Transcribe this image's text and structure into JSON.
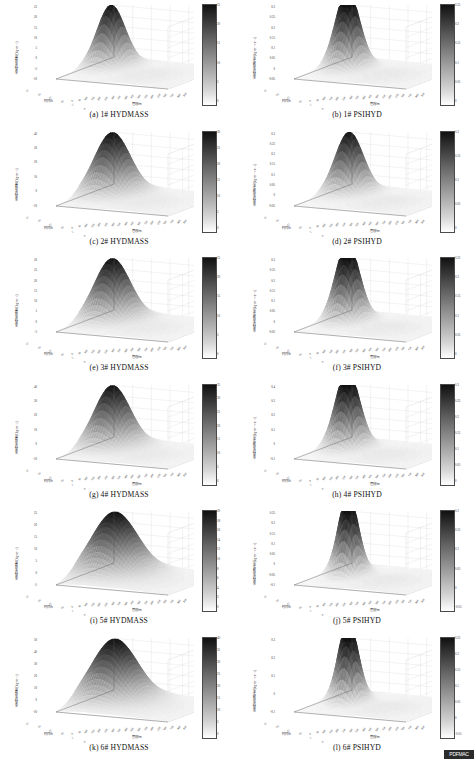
{
  "figure": {
    "axis_labels": {
      "vertical_mass": "水合物生成量/(kg·m⁻³)",
      "vertical_fraction": "水合物生成量/(kg·m⁻³·s⁻¹)",
      "time": "时间/h",
      "pipe": "管段/m"
    },
    "watermark": "PDFMAC"
  },
  "panels": [
    {
      "key": "a",
      "caption": "(a)  1# HYDMASS",
      "ylabel": "水合物生成量/(kg·m⁻³)",
      "xlabel_left": "时间/h",
      "xlabel_right": "管段/m",
      "yticks": [
        "25",
        "20",
        "15",
        "10",
        "5",
        "0",
        "-5",
        "-10"
      ],
      "xticks_left": [
        "25",
        "20",
        "15",
        "10",
        "5",
        "0"
      ],
      "xticks_right": [
        "0",
        "50",
        "100",
        "150",
        "200",
        "250",
        "300",
        "350",
        "400",
        "450",
        "500",
        "550",
        "600",
        "650",
        "700",
        "750",
        "800",
        "850"
      ],
      "colorbar_ticks": [
        "25",
        "20",
        "15",
        "10",
        "5",
        "0"
      ],
      "colorbar_min": 0,
      "colorbar_max": 25,
      "peak_value": 25,
      "peak_shape": "single-narrow",
      "base_color": "#9a9a9a"
    },
    {
      "key": "b",
      "caption": "(b)  1# PSIHYD",
      "ylabel": "水合物生成速率/(kg·m⁻³·s⁻¹)",
      "xlabel_left": "时间/h",
      "xlabel_right": "管段/m",
      "yticks": [
        "0.3",
        "0.25",
        "0.2",
        "0.15",
        "0.1",
        "0.05",
        "0",
        "-0.05"
      ],
      "xticks_left": [
        "25",
        "20",
        "15",
        "10",
        "5",
        "0"
      ],
      "xticks_right": [
        "0",
        "50",
        "100",
        "150",
        "200",
        "250",
        "300",
        "350",
        "400",
        "450",
        "500",
        "550",
        "600",
        "650",
        "700",
        "750",
        "800",
        "850"
      ],
      "colorbar_ticks": [
        "0.25",
        "0.2",
        "0.15",
        "0.1",
        "0.05",
        "0"
      ],
      "colorbar_min": 0,
      "colorbar_max": 0.25,
      "peak_value": 0.3,
      "peak_shape": "double-ridge",
      "base_color": "#9a9a9a"
    },
    {
      "key": "c",
      "caption": "(c)  2# HYDMASS",
      "ylabel": "水合物生成量/(kg·m⁻³)",
      "xlabel_left": "时间/h",
      "xlabel_right": "管段/m",
      "yticks": [
        "40",
        "30",
        "20",
        "10",
        "0",
        "-10"
      ],
      "xticks_left": [
        "25",
        "20",
        "15",
        "10",
        "5",
        "0"
      ],
      "xticks_right": [
        "0",
        "50",
        "100",
        "150",
        "200",
        "250",
        "300",
        "350",
        "400",
        "450",
        "500",
        "550",
        "600",
        "650",
        "700",
        "750",
        "800",
        "850"
      ],
      "colorbar_ticks": [
        "30",
        "25",
        "20",
        "15",
        "10",
        "5",
        "0"
      ],
      "colorbar_min": 0,
      "colorbar_max": 30,
      "peak_value": 35,
      "peak_shape": "single-broad",
      "base_color": "#9a9a9a"
    },
    {
      "key": "d",
      "caption": "(d)  2# PSIHYD",
      "ylabel": "水合物生成速率/(kg·m⁻³·s⁻¹)",
      "xlabel_left": "时间/h",
      "xlabel_right": "管段/m",
      "yticks": [
        "0.3",
        "0.25",
        "0.2",
        "0.15",
        "0.1",
        "0.05",
        "0",
        "-0.05"
      ],
      "xticks_left": [
        "25",
        "20",
        "15",
        "10",
        "5",
        "0"
      ],
      "xticks_right": [
        "0",
        "50",
        "100",
        "150",
        "200",
        "250",
        "300",
        "350",
        "400",
        "450",
        "500",
        "550",
        "600",
        "650",
        "700",
        "750",
        "800",
        "850"
      ],
      "colorbar_ticks": [
        "0.2",
        "0.15",
        "0.1",
        "0.05",
        "0"
      ],
      "colorbar_min": 0,
      "colorbar_max": 0.2,
      "peak_value": 0.28,
      "peak_shape": "single-narrow",
      "base_color": "#9a9a9a"
    },
    {
      "key": "e",
      "caption": "(e)  3# HYDMASS",
      "ylabel": "水合物生成量/(kg·m⁻³)",
      "xlabel_left": "时间/h",
      "xlabel_right": "管段/m",
      "yticks": [
        "30",
        "25",
        "20",
        "15",
        "10",
        "5",
        "0",
        "-5"
      ],
      "xticks_left": [
        "25",
        "20",
        "15",
        "10",
        "5",
        "0"
      ],
      "xticks_right": [
        "0",
        "50",
        "100",
        "150",
        "200",
        "250",
        "300",
        "350",
        "400",
        "450",
        "500",
        "550",
        "600",
        "650",
        "700",
        "750",
        "800",
        "850"
      ],
      "colorbar_ticks": [
        "25",
        "20",
        "15",
        "10",
        "5",
        "0"
      ],
      "colorbar_min": 0,
      "colorbar_max": 25,
      "peak_value": 30,
      "peak_shape": "single-broad",
      "base_color": "#9a9a9a"
    },
    {
      "key": "f",
      "caption": "(f)  3# PSIHYD",
      "ylabel": "水合物生成速率/(kg·m⁻³·s⁻¹)",
      "xlabel_left": "时间/h",
      "xlabel_right": "管段/m",
      "yticks": [
        "0.3",
        "0.25",
        "0.2",
        "0.15",
        "0.1",
        "0.05",
        "0",
        "-0.05"
      ],
      "xticks_left": [
        "25",
        "20",
        "15",
        "10",
        "5",
        "0"
      ],
      "xticks_right": [
        "0",
        "50",
        "100",
        "150",
        "200",
        "250",
        "300",
        "350",
        "400",
        "450",
        "500",
        "550",
        "600",
        "650",
        "700",
        "750",
        "800",
        "850"
      ],
      "colorbar_ticks": [
        "0.25",
        "0.2",
        "0.15",
        "0.1",
        "0.05",
        "0"
      ],
      "colorbar_min": 0,
      "colorbar_max": 0.25,
      "peak_value": 0.3,
      "peak_shape": "double-ridge",
      "base_color": "#9a9a9a"
    },
    {
      "key": "g",
      "caption": "(g)  4# HYDMASS",
      "ylabel": "水合物生成量/(kg·m⁻³)",
      "xlabel_left": "时间/h",
      "xlabel_right": "管段/m",
      "yticks": [
        "40",
        "30",
        "20",
        "10",
        "0",
        "-10"
      ],
      "xticks_left": [
        "25",
        "20",
        "15",
        "10",
        "5",
        "0"
      ],
      "xticks_right": [
        "0",
        "50",
        "100",
        "150",
        "200",
        "250",
        "300",
        "350",
        "400",
        "450",
        "500",
        "550",
        "600",
        "650",
        "700",
        "750",
        "800",
        "850"
      ],
      "colorbar_ticks": [
        "35",
        "30",
        "25",
        "20",
        "15",
        "10",
        "5",
        "0"
      ],
      "colorbar_min": 0,
      "colorbar_max": 35,
      "peak_value": 38,
      "peak_shape": "single-broad",
      "base_color": "#9a9a9a"
    },
    {
      "key": "h",
      "caption": "(h)  4# PSIHYD",
      "ylabel": "水合物生成速率/(kg·m⁻³·s⁻¹)",
      "xlabel_left": "时间/h",
      "xlabel_right": "管段/m",
      "yticks": [
        "0.4",
        "0.3",
        "0.2",
        "0.1",
        "0",
        "-0.1"
      ],
      "xticks_left": [
        "25",
        "20",
        "15",
        "10",
        "5",
        "0"
      ],
      "xticks_right": [
        "0",
        "50",
        "100",
        "150",
        "200",
        "250",
        "300",
        "350",
        "400",
        "450",
        "500",
        "550",
        "600",
        "650",
        "700",
        "750",
        "800",
        "850"
      ],
      "colorbar_ticks": [
        "0.3",
        "0.25",
        "0.2",
        "0.15",
        "0.1",
        "0.05",
        "0"
      ],
      "colorbar_min": 0,
      "colorbar_max": 0.3,
      "peak_value": 0.35,
      "peak_shape": "double-ridge",
      "base_color": "#9a9a9a"
    },
    {
      "key": "i",
      "caption": "(i)  5# HYDMASS",
      "ylabel": "水合物生成量/(kg·m⁻³)",
      "xlabel_left": "时间/h",
      "xlabel_right": "管段/m",
      "yticks": [
        "25",
        "20",
        "15",
        "10",
        "5",
        "0",
        "-5"
      ],
      "xticks_left": [
        "25",
        "20",
        "15",
        "10",
        "5",
        "0"
      ],
      "xticks_right": [
        "0",
        "50",
        "100",
        "150",
        "200",
        "250",
        "300",
        "350",
        "400",
        "450",
        "500",
        "550",
        "600",
        "650",
        "700",
        "750",
        "800",
        "850"
      ],
      "colorbar_ticks": [
        "20",
        "18",
        "16",
        "14",
        "12",
        "10",
        "8",
        "6",
        "4",
        "2",
        "0"
      ],
      "colorbar_min": 0,
      "colorbar_max": 20,
      "peak_value": 22,
      "peak_shape": "dome",
      "base_color": "#9a9a9a"
    },
    {
      "key": "j",
      "caption": "(j)  5# PSIHYD",
      "ylabel": "水合物生成速率/(kg·m⁻³·s⁻¹)",
      "xlabel_left": "时间/h",
      "xlabel_right": "管段/m",
      "yticks": [
        "0.25",
        "0.2",
        "0.15",
        "0.1",
        "0.05",
        "0",
        "-0.05",
        "-0.1"
      ],
      "xticks_left": [
        "25",
        "20",
        "15",
        "10",
        "5",
        "0"
      ],
      "xticks_right": [
        "0",
        "50",
        "100",
        "150",
        "200",
        "250",
        "300",
        "350",
        "400",
        "450",
        "500",
        "550",
        "600",
        "650",
        "700",
        "750",
        "800",
        "850"
      ],
      "colorbar_ticks": [
        "0.2",
        "0.15",
        "0.1",
        "0.05",
        "0",
        "-0.05"
      ],
      "colorbar_min": -0.05,
      "colorbar_max": 0.2,
      "peak_value": 0.22,
      "peak_shape": "multi-ridge",
      "base_color": "#9a9a9a"
    },
    {
      "key": "k",
      "caption": "(k)  6# HYDMASS",
      "ylabel": "水合物生成量/(kg·m⁻³)",
      "xlabel_left": "时间/h",
      "xlabel_right": "管段/m",
      "yticks": [
        "50",
        "40",
        "30",
        "20",
        "10",
        "0",
        "-10"
      ],
      "xticks_left": [
        "25",
        "20",
        "15",
        "10",
        "5",
        "0"
      ],
      "xticks_right": [
        "0",
        "50",
        "100",
        "150",
        "200",
        "250",
        "300",
        "350",
        "400",
        "450",
        "500",
        "550",
        "600",
        "650",
        "700",
        "750",
        "800",
        "850"
      ],
      "colorbar_ticks": [
        "40",
        "35",
        "30",
        "25",
        "20",
        "15",
        "10",
        "5",
        "0"
      ],
      "colorbar_min": 0,
      "colorbar_max": 40,
      "peak_value": 48,
      "peak_shape": "dome",
      "base_color": "#9a9a9a"
    },
    {
      "key": "l",
      "caption": "(l)  6# PSIHYD",
      "ylabel": "水合物生成速率/(kg·m⁻³·s⁻¹)",
      "xlabel_left": "时间/h",
      "xlabel_right": "管段/m",
      "yticks": [
        "0.3",
        "0.2",
        "0.1",
        "0",
        "-0.1"
      ],
      "xticks_left": [
        "25",
        "20",
        "15",
        "10",
        "5",
        "0"
      ],
      "xticks_right": [
        "0",
        "50",
        "100",
        "150",
        "200",
        "250",
        "300",
        "350",
        "400",
        "450",
        "500",
        "550",
        "600",
        "650",
        "700",
        "750",
        "800",
        "850"
      ],
      "colorbar_ticks": [
        "0.25",
        "0.2",
        "0.15",
        "0.1",
        "0.05",
        "0",
        "-0.05"
      ],
      "colorbar_min": -0.05,
      "colorbar_max": 0.25,
      "peak_value": 0.3,
      "peak_shape": "multi-ridge",
      "base_color": "#9a9a9a"
    }
  ],
  "chart_data": {
    "type": "surface",
    "n_panels": 12,
    "grid": "6 rows x 2 columns",
    "title": "",
    "xlabel": "时间/h",
    "ylabel": "管段/m",
    "zlabel": "水合物生成量/(kg·m⁻³)",
    "legend": "grayscale colorbar per panel",
    "grid_on": true,
    "x_range": [
      0,
      25
    ],
    "y_range": [
      0,
      850
    ],
    "series": [
      {
        "name": "(a) 1# HYDMASS",
        "zlim": [
          -10,
          25
        ],
        "peak": 25,
        "colorbar": [
          0,
          25
        ]
      },
      {
        "name": "(b) 1# PSIHYD",
        "zlim": [
          -0.05,
          0.3
        ],
        "peak": 0.3,
        "colorbar": [
          0,
          0.25
        ]
      },
      {
        "name": "(c) 2# HYDMASS",
        "zlim": [
          -10,
          40
        ],
        "peak": 35,
        "colorbar": [
          0,
          30
        ]
      },
      {
        "name": "(d) 2# PSIHYD",
        "zlim": [
          -0.05,
          0.3
        ],
        "peak": 0.28,
        "colorbar": [
          0,
          0.2
        ]
      },
      {
        "name": "(e) 3# HYDMASS",
        "zlim": [
          -5,
          30
        ],
        "peak": 30,
        "colorbar": [
          0,
          25
        ]
      },
      {
        "name": "(f) 3# PSIHYD",
        "zlim": [
          -0.05,
          0.3
        ],
        "peak": 0.3,
        "colorbar": [
          0,
          0.25
        ]
      },
      {
        "name": "(g) 4# HYDMASS",
        "zlim": [
          -10,
          40
        ],
        "peak": 38,
        "colorbar": [
          0,
          35
        ]
      },
      {
        "name": "(h) 4# PSIHYD",
        "zlim": [
          -0.1,
          0.4
        ],
        "peak": 0.35,
        "colorbar": [
          0,
          0.3
        ]
      },
      {
        "name": "(i) 5# HYDMASS",
        "zlim": [
          -5,
          25
        ],
        "peak": 22,
        "colorbar": [
          0,
          20
        ]
      },
      {
        "name": "(j) 5# PSIHYD",
        "zlim": [
          -0.1,
          0.25
        ],
        "peak": 0.22,
        "colorbar": [
          -0.05,
          0.2
        ]
      },
      {
        "name": "(k) 6# HYDMASS",
        "zlim": [
          -10,
          50
        ],
        "peak": 48,
        "colorbar": [
          0,
          40
        ]
      },
      {
        "name": "(l) 6# PSIHYD",
        "zlim": [
          -0.1,
          0.3
        ],
        "peak": 0.3,
        "colorbar": [
          -0.05,
          0.25
        ]
      }
    ]
  }
}
